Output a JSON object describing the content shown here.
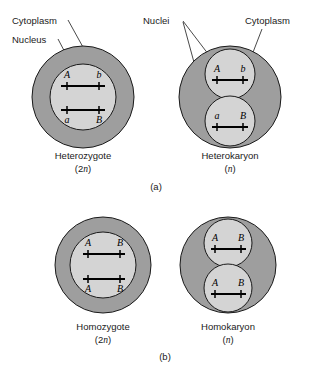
{
  "figure": {
    "background_color": "#ffffff",
    "cytoplasm_color": "#9e9e9e",
    "nucleus_color": "#d4d4d4",
    "outline_color": "#1a1a1a",
    "chromosome_color": "#000000"
  },
  "annotations": {
    "cytoplasm_left": "Cytoplasm",
    "nucleus_left": "Nucleus",
    "nuclei_right": "Nuclei",
    "cytoplasm_right": "Cytoplasm"
  },
  "panels": [
    {
      "id": "a",
      "label": "(a)",
      "cells": [
        {
          "id": "heterozygote",
          "name": "Heterozygote",
          "ploidy": "(2n)",
          "ploidy_prefix": "(2",
          "ploidy_italic": "n",
          "ploidy_suffix": ")",
          "nuclei_count": 1,
          "chromosomes": [
            {
              "left_allele": "A",
              "right_allele": "b",
              "label_position": "above"
            },
            {
              "left_allele": "a",
              "right_allele": "B",
              "label_position": "below"
            }
          ]
        },
        {
          "id": "heterokaryon",
          "name": "Heterokaryon",
          "ploidy": "(n)",
          "ploidy_prefix": "(",
          "ploidy_italic": "n",
          "ploidy_suffix": ")",
          "nuclei_count": 2,
          "chromosomes": [
            {
              "left_allele": "A",
              "right_allele": "b",
              "label_position": "above"
            },
            {
              "left_allele": "a",
              "right_allele": "B",
              "label_position": "above"
            }
          ]
        }
      ]
    },
    {
      "id": "b",
      "label": "(b)",
      "cells": [
        {
          "id": "homozygote",
          "name": "Homozygote",
          "ploidy": "(2n)",
          "ploidy_prefix": "(2",
          "ploidy_italic": "n",
          "ploidy_suffix": ")",
          "nuclei_count": 1,
          "chromosomes": [
            {
              "left_allele": "A",
              "right_allele": "B",
              "label_position": "above"
            },
            {
              "left_allele": "A",
              "right_allele": "B",
              "label_position": "below"
            }
          ]
        },
        {
          "id": "homokaryon",
          "name": "Homokaryon",
          "ploidy": "(n)",
          "ploidy_prefix": "(",
          "ploidy_italic": "n",
          "ploidy_suffix": ")",
          "nuclei_count": 2,
          "chromosomes": [
            {
              "left_allele": "A",
              "right_allele": "B",
              "label_position": "above"
            },
            {
              "left_allele": "A",
              "right_allele": "B",
              "label_position": "above"
            }
          ]
        }
      ]
    }
  ]
}
